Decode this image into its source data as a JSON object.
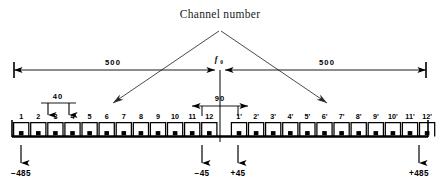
{
  "diagram": {
    "title": "Channel number",
    "center_label": {
      "symbol": "f",
      "subscript": "0"
    },
    "dimensions": [
      {
        "name": "left-span",
        "value": "500"
      },
      {
        "name": "right-span",
        "value": "500"
      },
      {
        "name": "channel-pitch",
        "value": "40"
      },
      {
        "name": "center-gap",
        "value": "90"
      }
    ],
    "coordinates": [
      {
        "name": "left-outer",
        "value": "-485"
      },
      {
        "name": "left-inner",
        "value": "-45"
      },
      {
        "name": "right-inner",
        "value": "+45"
      },
      {
        "name": "right-outer",
        "value": "+485"
      }
    ],
    "left_channels": [
      "1",
      "2",
      "3",
      "4",
      "5",
      "6",
      "7",
      "8",
      "9",
      "10",
      "11",
      "12"
    ],
    "right_channels": [
      "1'",
      "2'",
      "3'",
      "4'",
      "5'",
      "6'",
      "7'",
      "8'",
      "9'",
      "10'",
      "11'",
      "12'"
    ],
    "colors": {
      "ink": "#000000",
      "background": "#ffffff",
      "leader": "#2a2a2a"
    }
  }
}
